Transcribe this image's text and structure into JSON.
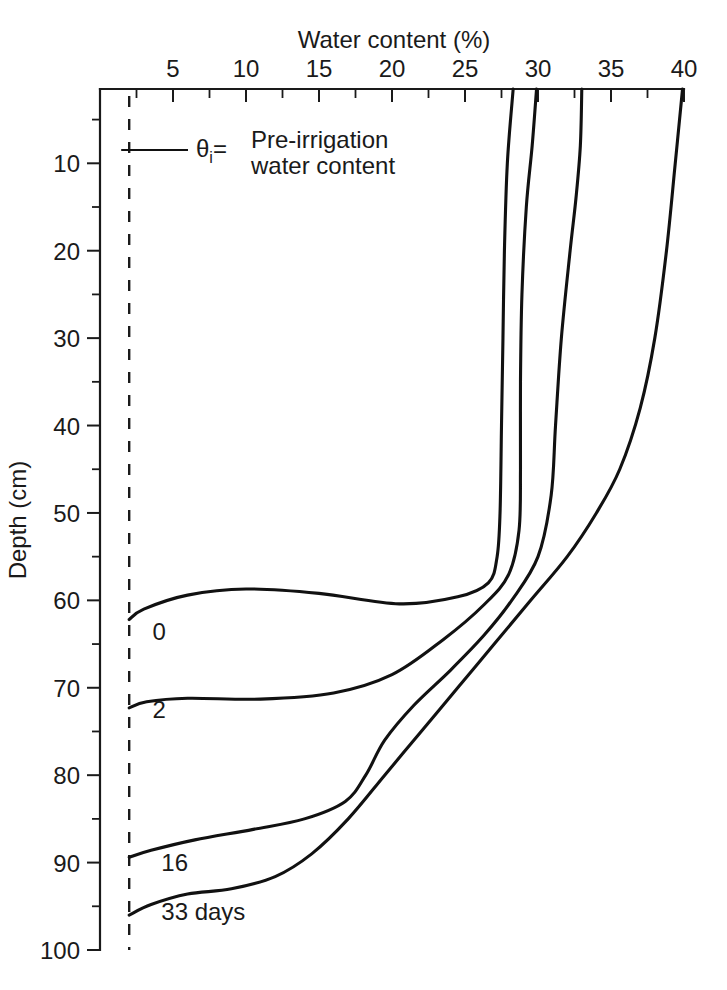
{
  "chart_data": {
    "type": "line",
    "title": "",
    "xlabel": "Water content (%)",
    "ylabel": "Depth (cm)",
    "xlim": [
      0,
      40
    ],
    "ylim": [
      100,
      1.5
    ],
    "x_axis_position": "top",
    "y_axis_direction": "inverted",
    "grid": false,
    "legend": "inline-curve-labels",
    "xticks_major": [
      5,
      10,
      15,
      20,
      25,
      30,
      35,
      40
    ],
    "xticks_major_labels": [
      "5",
      "10",
      "15",
      "20",
      "25",
      "30",
      "35",
      "40"
    ],
    "xticks_minor": [
      0,
      2.5,
      7.5,
      12.5,
      17.5,
      22.5,
      27.5,
      32.5,
      37.5
    ],
    "yticks_major": [
      10,
      20,
      30,
      40,
      50,
      60,
      70,
      80,
      90,
      100
    ],
    "yticks_major_labels": [
      "10",
      "20",
      "30",
      "40",
      "50",
      "60",
      "70",
      "80",
      "90",
      "100"
    ],
    "yticks_minor": [
      5,
      15,
      25,
      35,
      45,
      55,
      65,
      75,
      85,
      95
    ],
    "annotations": [
      {
        "name": "pre-irrigation-reference",
        "symbol": "θ",
        "subscript": "i",
        "equals": "=",
        "text_line_1": "Pre-irrigation",
        "text_line_2": "water content",
        "value": 2.0,
        "style": "dashed vertical line"
      }
    ],
    "series": [
      {
        "name": "0",
        "label": "0",
        "label_position": {
          "water_content": 3.6,
          "depth": 64.5
        },
        "points": [
          {
            "water_content": 28.3,
            "depth": 1.5
          },
          {
            "water_content": 27.9,
            "depth": 10
          },
          {
            "water_content": 27.7,
            "depth": 20
          },
          {
            "water_content": 27.6,
            "depth": 30
          },
          {
            "water_content": 27.5,
            "depth": 40
          },
          {
            "water_content": 27.4,
            "depth": 50
          },
          {
            "water_content": 27.2,
            "depth": 55
          },
          {
            "water_content": 26.6,
            "depth": 58
          },
          {
            "water_content": 24.5,
            "depth": 59.6
          },
          {
            "water_content": 20.5,
            "depth": 60.4
          },
          {
            "water_content": 15.0,
            "depth": 59.2
          },
          {
            "water_content": 10.0,
            "depth": 58.7
          },
          {
            "water_content": 6.0,
            "depth": 59.4
          },
          {
            "water_content": 3.0,
            "depth": 61.0
          },
          {
            "water_content": 2.0,
            "depth": 62.2
          }
        ]
      },
      {
        "name": "2",
        "label": "2",
        "label_position": {
          "water_content": 3.6,
          "depth": 73.5
        },
        "points": [
          {
            "water_content": 29.9,
            "depth": 1.5
          },
          {
            "water_content": 29.6,
            "depth": 8
          },
          {
            "water_content": 29.2,
            "depth": 15
          },
          {
            "water_content": 28.9,
            "depth": 25
          },
          {
            "water_content": 28.8,
            "depth": 35
          },
          {
            "water_content": 28.8,
            "depth": 45
          },
          {
            "water_content": 28.7,
            "depth": 52
          },
          {
            "water_content": 28.0,
            "depth": 57
          },
          {
            "water_content": 26.3,
            "depth": 60.5
          },
          {
            "water_content": 23.5,
            "depth": 64.5
          },
          {
            "water_content": 20.0,
            "depth": 68.5
          },
          {
            "water_content": 16.0,
            "depth": 70.6
          },
          {
            "water_content": 11.0,
            "depth": 71.3
          },
          {
            "water_content": 6.0,
            "depth": 71.2
          },
          {
            "water_content": 3.2,
            "depth": 71.6
          },
          {
            "water_content": 2.0,
            "depth": 72.3
          }
        ]
      },
      {
        "name": "16",
        "label": "16",
        "label_position": {
          "water_content": 4.2,
          "depth": 91.0
        },
        "points": [
          {
            "water_content": 33.0,
            "depth": 1.5
          },
          {
            "water_content": 32.9,
            "depth": 8
          },
          {
            "water_content": 32.6,
            "depth": 14
          },
          {
            "water_content": 32.2,
            "depth": 20
          },
          {
            "water_content": 31.6,
            "depth": 30
          },
          {
            "water_content": 31.2,
            "depth": 40
          },
          {
            "water_content": 30.9,
            "depth": 48
          },
          {
            "water_content": 30.0,
            "depth": 55
          },
          {
            "water_content": 28.2,
            "depth": 60
          },
          {
            "water_content": 26.3,
            "depth": 64
          },
          {
            "water_content": 24.0,
            "depth": 68
          },
          {
            "water_content": 21.5,
            "depth": 72
          },
          {
            "water_content": 19.5,
            "depth": 76
          },
          {
            "water_content": 18.2,
            "depth": 80
          },
          {
            "water_content": 16.8,
            "depth": 83
          },
          {
            "water_content": 14.0,
            "depth": 85
          },
          {
            "water_content": 10.5,
            "depth": 86.2
          },
          {
            "water_content": 6.5,
            "depth": 87.4
          },
          {
            "water_content": 3.5,
            "depth": 88.6
          },
          {
            "water_content": 2.0,
            "depth": 89.4
          }
        ]
      },
      {
        "name": "33 days",
        "label": "33 days",
        "label_position": {
          "water_content": 4.2,
          "depth": 96.6
        },
        "points": [
          {
            "water_content": 39.9,
            "depth": 1.5
          },
          {
            "water_content": 39.4,
            "depth": 10
          },
          {
            "water_content": 38.8,
            "depth": 20
          },
          {
            "water_content": 38.0,
            "depth": 30
          },
          {
            "water_content": 37.0,
            "depth": 38
          },
          {
            "water_content": 35.6,
            "depth": 45
          },
          {
            "water_content": 34.0,
            "depth": 50
          },
          {
            "water_content": 32.0,
            "depth": 55
          },
          {
            "water_content": 29.5,
            "depth": 60
          },
          {
            "water_content": 27.0,
            "depth": 65
          },
          {
            "water_content": 24.5,
            "depth": 70
          },
          {
            "water_content": 22.0,
            "depth": 75
          },
          {
            "water_content": 19.5,
            "depth": 80
          },
          {
            "water_content": 17.0,
            "depth": 85
          },
          {
            "water_content": 14.5,
            "depth": 89
          },
          {
            "water_content": 12.0,
            "depth": 91.6
          },
          {
            "water_content": 9.0,
            "depth": 93.0
          },
          {
            "water_content": 6.0,
            "depth": 93.6
          },
          {
            "water_content": 3.5,
            "depth": 94.8
          },
          {
            "water_content": 2.0,
            "depth": 96.0
          }
        ]
      }
    ]
  },
  "colors": {
    "curve": "#111111",
    "axis": "#1a1a1a",
    "background": "#ffffff"
  }
}
